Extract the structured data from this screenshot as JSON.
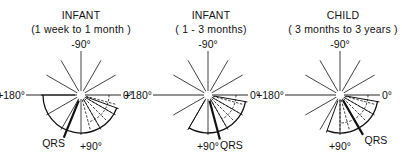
{
  "diagrams": [
    {
      "title": "INFANT",
      "subtitle": "(1 week to 1 month )",
      "center": [
        81,
        95
      ],
      "labels": {
        "top": "-90°",
        "left": "+180°",
        "right": "0°",
        "bottom": "+90°",
        "qrs": "QRS"
      },
      "solid_arc_deg": [
        20,
        180
      ],
      "dashed_arc_deg": [
        0,
        75
      ],
      "qrs_axis_deg": 112
    },
    {
      "title": "INFANT",
      "subtitle": "( 1 - 3  months)",
      "center": [
        208,
        95
      ],
      "labels": {
        "top": "-90°",
        "left": "+180°",
        "right": "0°",
        "bottom": "+90°",
        "qrs": "QRS"
      },
      "solid_arc_deg": [
        10,
        120
      ],
      "dashed_arc_deg": [
        0,
        60
      ],
      "qrs_axis_deg": 75
    },
    {
      "title": "CHILD",
      "subtitle": "( 3 months to  3 years )",
      "center": [
        340,
        95
      ],
      "labels": {
        "top": "-90°",
        "left": "+180°",
        "right": "0°",
        "bottom": "+90°",
        "qrs": "QRS"
      },
      "solid_arc_deg": [
        10,
        110
      ],
      "dashed_arc_deg": [
        0,
        90
      ],
      "qrs_axis_deg": 60
    }
  ],
  "style": {
    "ink": "#111111",
    "background": "#ffffff"
  }
}
